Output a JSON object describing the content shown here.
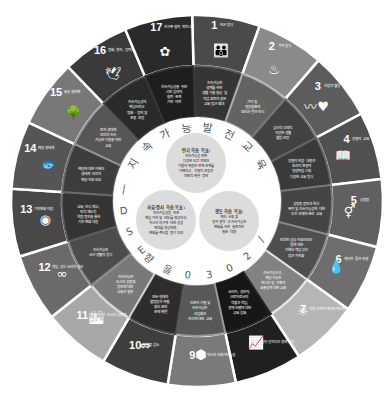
{
  "diagram": {
    "ring_text_top": "지 속 가 능 발 전 교 육",
    "ring_text_bottom": "ESD 를 위한 2030",
    "ring_chars_top": [
      "지",
      "속",
      "가",
      "능",
      "발",
      "전",
      "교",
      "육"
    ],
    "ring_chars_bottom": [
      "2",
      "0",
      "3",
      "0",
      "을",
      "향",
      "한"
    ],
    "ring_chars_left": [
      "E",
      "S",
      "D",
      "|"
    ],
    "center_circles": [
      {
        "id": "cognitive",
        "title": "인지 학습 목표:",
        "body": [
          "지속가능성 관련",
          "다양한 도전 과제와",
          "이들의 복잡한 연계 관계를",
          "이해하고, 전체적 관점과",
          "대안적 해결 방안"
        ]
      },
      {
        "id": "social",
        "title": "사회·정서 학습 목표:",
        "body": [
          "지속가능성을 위한",
          "핵심 가치 및 태도를 형성하고,",
          "자신과 지구에 대한 공감",
          "연대를 형성하며,",
          "변화를 주도할 동기 부여"
        ]
      },
      {
        "id": "behavioral",
        "title": "행동 학습 목표:",
        "body": [
          "개인, 사회 및",
          "정치 영역 내 지속가능한",
          "변화를 위한 실천적인",
          "실천 역량"
        ]
      }
    ],
    "goals": [
      {
        "num": "1",
        "name": "빈곤 종식",
        "icon": "family-icon",
        "inner": [
          "지속가능한",
          "생계를 위한",
          "생활 기술 향상 및",
          "직업 훈련과 같은",
          "교육 접근 확대"
        ],
        "shade": "#4a4a4a"
      },
      {
        "num": "2",
        "name": "기아 종식",
        "icon": "bowl-icon",
        "inner": [
          "기아 및",
          "영양실조의",
          "원인과 결과 인식"
        ],
        "shade": "#8a8a8a"
      },
      {
        "num": "3",
        "name": "건강과 웰빙",
        "icon": "heartbeat-icon",
        "inner": [
          "심리적·신체적",
          "건강한 생활",
          "웰빙 보장"
        ],
        "shade": "#5c5c5c"
      },
      {
        "num": "4",
        "name": "양질의 교육",
        "icon": "book-icon",
        "inner": [
          "양질의 학습 내용과",
          "효과적 환경의",
          "평생학습 기회",
          "다양한 교육 방식"
        ],
        "shade": "#505050"
      },
      {
        "num": "5",
        "name": "성평등",
        "icon": "gender-icon",
        "inner": [
          "성평등 증진과 특히",
          "폭력 및 지속가능성에 대한",
          "도전 과제에 관한 교육"
        ],
        "shade": "#606060"
      },
      {
        "num": "6",
        "name": "깨끗한 물과 위생",
        "icon": "water-icon",
        "inner": [
          "안전한 공공 자원으로서",
          "물에 대한",
          "이해와 책임 있는",
          "접근 가치화"
        ],
        "shade": "#6e6e6e"
      },
      {
        "num": "7",
        "name": "적정 가격의 깨끗한 에너지",
        "icon": "sun-icon",
        "inner": [
          "지속가능하고,",
          "재생 가능한",
          "에너지 및 전환과",
          "효율성에 대한 교육"
        ],
        "shade": "#b5b5b5"
      },
      {
        "num": "8",
        "name": "양질의 일자리와 경제 성장",
        "icon": "growth-chart-icon",
        "inner": [
          "소비자, 생산자,",
          "근로자로서의",
          "역할과 책임,",
          "경제 모델에 대한",
          "교육 강화"
        ],
        "shade": "#202020"
      },
      {
        "num": "9",
        "name": "산업, 혁신과 사회기반시설",
        "icon": "cubes-icon",
        "inner": [
          "인프라 기술 및",
          "지속가능한",
          "산업화와",
          "혁신에 대한 교육"
        ],
        "shade": "#7a7a7a"
      },
      {
        "num": "10",
        "name": "불평등 감소",
        "icon": "equality-arrows-icon",
        "inner": [
          "모든 형태의",
          "불평등과 차별,",
          "혐오 표현",
          "문제 해결"
        ],
        "shade": "#3e3e3e"
      },
      {
        "num": "11",
        "name": "지속가능한 도시와 공동체",
        "icon": "city-icon",
        "inner": [
          "지속가능한",
          "도시와 공동체",
          "방안에 대한",
          "교육과 실천"
        ],
        "shade": "#a8a8a8"
      },
      {
        "num": "12",
        "name": "책임 있는 소비와 생산",
        "icon": "infinity-icon",
        "inner": [
          "지속가능한",
          "소비 생활의 방식"
        ],
        "shade": "#6a6a6a"
      },
      {
        "num": "13",
        "name": "기후변화 대응",
        "icon": "eye-globe-icon",
        "inner": [
          "교육, 인식 제고,",
          "인적 제도적",
          "역량 증진을 통한",
          "기후 변화 대응"
        ],
        "shade": "#484848"
      },
      {
        "num": "14",
        "name": "해양 생태계",
        "icon": "fish-icon",
        "inner": [
          "해양에 대한 이해와",
          "생태계 보전과",
          "해양 자원 보호"
        ],
        "shade": "#555555"
      },
      {
        "num": "15",
        "name": "육상 생태계",
        "icon": "tree-icon",
        "inner": [
          "토지 생태계",
          "보전과 지속",
          "가능한 이용을 위한",
          "교육"
        ],
        "shade": "#787878"
      },
      {
        "num": "16",
        "name": "평화, 정의, 강력한 제도",
        "icon": "dove-icon",
        "inner": [
          "지속가능성의",
          "핵심으로서",
          "평화 · 정의 및",
          "포용 보장"
        ],
        "shade": "#3a3a3a"
      },
      {
        "num": "17",
        "name": "지구촌 협력 파트너십",
        "icon": "flower-icon",
        "inner": [
          "지속가능성을 위한",
          "시민 참여의",
          "협력 관계",
          "기반 마련"
        ],
        "shade": "#2a2a2a"
      }
    ]
  }
}
